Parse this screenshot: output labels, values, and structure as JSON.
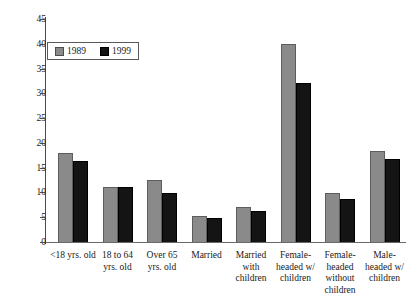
{
  "chart_data": {
    "type": "bar",
    "title": "",
    "xlabel": "",
    "ylabel": "",
    "ylim": [
      0,
      45
    ],
    "yticks": [
      0,
      5,
      10,
      15,
      20,
      25,
      30,
      35,
      40,
      45
    ],
    "grid": false,
    "legend_position": "top-left",
    "categories": [
      "<18 yrs. old",
      "18 to 64 yrs. old",
      "Over 65 yrs. old",
      "Married",
      "Married with children",
      "Female-headed w/ children",
      "Female-headed without children",
      "Male-headed w/ children"
    ],
    "category_lines": [
      [
        "<18 yrs. old"
      ],
      [
        "18 to 64",
        "yrs. old"
      ],
      [
        "Over 65",
        "yrs. old"
      ],
      [
        "Married"
      ],
      [
        "Married",
        "with",
        "children"
      ],
      [
        "Female-",
        "headed w/",
        "children"
      ],
      [
        "Female-",
        "headed",
        "without",
        "children"
      ],
      [
        "Male-",
        "headed w/",
        "children"
      ]
    ],
    "series": [
      {
        "name": "1989",
        "color": "#8a8a8a",
        "values": [
          18.0,
          11.2,
          12.5,
          5.3,
          7.0,
          40.0,
          9.8,
          18.4
        ]
      },
      {
        "name": "1999",
        "color": "#141414",
        "values": [
          16.3,
          11.2,
          9.9,
          4.9,
          6.3,
          32.1,
          8.6,
          16.7
        ]
      }
    ]
  },
  "legend": {
    "items": [
      {
        "label": "1989",
        "color": "#8a8a8a"
      },
      {
        "label": "1999",
        "color": "#141414"
      }
    ]
  }
}
